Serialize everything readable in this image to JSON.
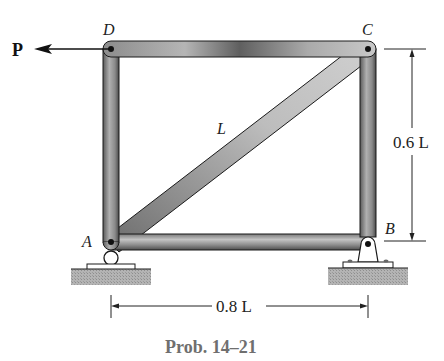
{
  "figure": {
    "caption": "Prob. 14–21",
    "joints": {
      "A": {
        "label": "A",
        "x": 111,
        "y": 242
      },
      "B": {
        "label": "B",
        "x": 368,
        "y": 242
      },
      "C": {
        "label": "C",
        "x": 368,
        "y": 49
      },
      "D": {
        "label": "D",
        "x": 111,
        "y": 49
      }
    },
    "members": [
      {
        "name": "DC",
        "from": "D",
        "to": "C"
      },
      {
        "name": "DA",
        "from": "D",
        "to": "A"
      },
      {
        "name": "CB",
        "from": "C",
        "to": "B"
      },
      {
        "name": "AB",
        "from": "A",
        "to": "B"
      },
      {
        "name": "AC",
        "from": "A",
        "to": "C",
        "label": "L"
      }
    ],
    "load": {
      "label": "P",
      "at": "D",
      "direction": "left"
    },
    "supports": {
      "A": "roller",
      "B": "pin"
    },
    "dimensions": {
      "horizontal": "0.8 L",
      "vertical": "0.6 L"
    },
    "diagonal_label": "L",
    "colors": {
      "member_dark": "#4a4a4a",
      "member_light": "#b8b8b8",
      "outline": "#1a1a1a",
      "ground": "#a8a8a8",
      "caption": "#6f6f6f"
    }
  }
}
